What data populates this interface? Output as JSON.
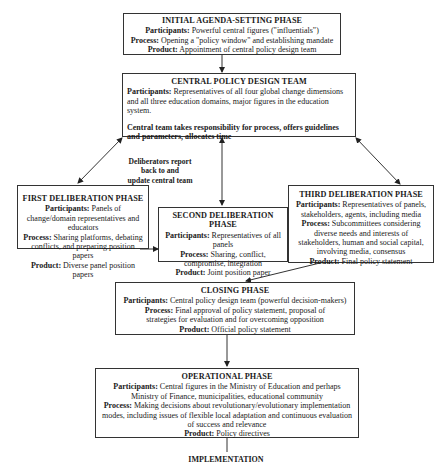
{
  "diagram": {
    "initial": {
      "title": "INITIAL AGENDA-SETTING PHASE",
      "participants_label": "Participants:",
      "participants": "Powerful central figures (\"influentials\")",
      "process_label": "Process:",
      "process": "Opening a \"policy window\" and establishing mandate",
      "product_label": "Product:",
      "product": "Appointment of central policy design team"
    },
    "central": {
      "title": "CENTRAL POLICY DESIGN TEAM",
      "participants_label": "Participants:",
      "participants": "Representatives of all four global change dimensions and all three education domains, major figures in the education system.",
      "responsibility": "Central team takes responsibility for process, offers guidelines and parameters, allocates time"
    },
    "note": {
      "line1": "Deliberators report",
      "line2": "back to and",
      "line3": "update central team"
    },
    "first": {
      "title": "FIRST DELIBERATION PHASE",
      "participants_label": "Participants:",
      "participants": "Panels of change/domain representatives and educators",
      "process_label": "Process:",
      "process": "Sharing platforms, debating conflicts, and preparing position papers",
      "product_label": "Product:",
      "product": "Diverse panel position papers"
    },
    "second": {
      "title": "SECOND DELIBERATION PHASE",
      "participants_label": "Participants:",
      "participants": "Representatives of all panels",
      "process_label": "Process:",
      "process": "Sharing, conflict, compromise, integration",
      "product_label": "Product:",
      "product": "Joint position paper"
    },
    "third": {
      "title": "THIRD DELIBERATION PHASE",
      "participants_label": "Participants:",
      "participants": "Representatives of panels, stakeholders, agents, including media",
      "process_label": "Process:",
      "process": "Subcommittees considering diverse needs and interests of stakeholders, human and social capital, involving media, consensus",
      "product_label": "Product:",
      "product": "Final policy statement"
    },
    "closing": {
      "title": "CLOSING PHASE",
      "participants_label": "Participants:",
      "participants": "Central policy design team (powerful decision-makers)",
      "process_label": "Process:",
      "process": "Final approval of policy statement, proposal of strategies for evaluation and for overcoming opposition",
      "product_label": "Product:",
      "product": "Official policy statement"
    },
    "operational": {
      "title": "OPERATIONAL PHASE",
      "participants_label": "Participants:",
      "participants": "Central figures in the Ministry of Education and perhaps Ministry of Finance, municipalities, educational community",
      "process_label": "Process:",
      "process": "Making decisions about revolutionary/evolutionary implementation modes, including issues of flexible local adaptation and continuous evaluation of success and relevance",
      "product_label": "Product:",
      "product": "Policy directives"
    },
    "implementation": "IMPLEMENTATION"
  }
}
